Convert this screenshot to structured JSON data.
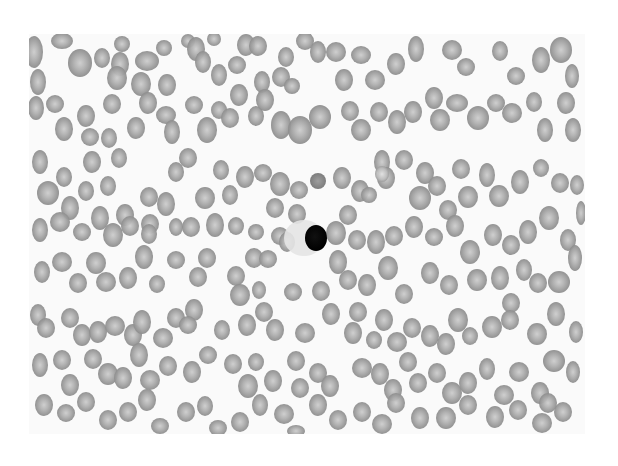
{
  "image": {
    "subject": "blood smear micrograph",
    "description": "Grayscale peripheral blood smear showing numerous red blood cells surrounding a single dark-stained nucleated cell near the center",
    "frame": {
      "x": 29,
      "y": 34,
      "width": 556,
      "height": 400
    },
    "colors": {
      "page_bg": "#ffffff",
      "field_bg": "#fafafa",
      "rbc_rim": "#8f8f8f",
      "rbc_center": "#c9c9c9",
      "rbc_dark": "#7e7e7e",
      "nucleus": "#0a0a0a",
      "halo": "#e2e2e2"
    }
  },
  "dark_cell": {
    "cx": 316,
    "cy": 238,
    "rx": 11,
    "ry": 13,
    "halo": {
      "cx": 304,
      "cy": 238,
      "rx": 20,
      "ry": 18
    }
  },
  "cells": [
    [
      34,
      52,
      9,
      16,
      0
    ],
    [
      62,
      41,
      11,
      8,
      0
    ],
    [
      80,
      63,
      12,
      14,
      0
    ],
    [
      102,
      58,
      8,
      10,
      0
    ],
    [
      38,
      82,
      8,
      13,
      0
    ],
    [
      122,
      44,
      8,
      8,
      0
    ],
    [
      120,
      64,
      9,
      12,
      0
    ],
    [
      117,
      78,
      10,
      12,
      0
    ],
    [
      147,
      61,
      12,
      10,
      0
    ],
    [
      141,
      84,
      10,
      12,
      0
    ],
    [
      164,
      48,
      8,
      8,
      0
    ],
    [
      188,
      41,
      7,
      7,
      0
    ],
    [
      167,
      85,
      9,
      11,
      0
    ],
    [
      196,
      49,
      9,
      12,
      0
    ],
    [
      203,
      62,
      8,
      11,
      0
    ],
    [
      219,
      75,
      8,
      11,
      0
    ],
    [
      214,
      39,
      7,
      7,
      0
    ],
    [
      246,
      45,
      9,
      11,
      0
    ],
    [
      258,
      46,
      9,
      10,
      0
    ],
    [
      286,
      57,
      8,
      10,
      0
    ],
    [
      305,
      41,
      9,
      9,
      0
    ],
    [
      237,
      65,
      9,
      9,
      0
    ],
    [
      281,
      77,
      9,
      10,
      0
    ],
    [
      262,
      82,
      8,
      11,
      0
    ],
    [
      292,
      86,
      8,
      8,
      0
    ],
    [
      318,
      52,
      8,
      11,
      0
    ],
    [
      336,
      52,
      10,
      10,
      0
    ],
    [
      361,
      55,
      10,
      9,
      0
    ],
    [
      344,
      80,
      9,
      11,
      0
    ],
    [
      375,
      80,
      10,
      10,
      0
    ],
    [
      396,
      64,
      9,
      11,
      0
    ],
    [
      416,
      49,
      8,
      13,
      0
    ],
    [
      452,
      50,
      10,
      10,
      0
    ],
    [
      466,
      67,
      9,
      9,
      0
    ],
    [
      500,
      51,
      8,
      10,
      0
    ],
    [
      516,
      76,
      9,
      9,
      0
    ],
    [
      541,
      60,
      9,
      13,
      0
    ],
    [
      561,
      50,
      11,
      13,
      0
    ],
    [
      572,
      76,
      7,
      12,
      0
    ],
    [
      36,
      108,
      8,
      12,
      0
    ],
    [
      55,
      104,
      9,
      9,
      0
    ],
    [
      64,
      129,
      9,
      12,
      0
    ],
    [
      86,
      116,
      9,
      11,
      0
    ],
    [
      90,
      137,
      9,
      9,
      0
    ],
    [
      112,
      104,
      9,
      10,
      0
    ],
    [
      109,
      138,
      8,
      10,
      0
    ],
    [
      136,
      128,
      9,
      11,
      0
    ],
    [
      148,
      103,
      9,
      11,
      0
    ],
    [
      166,
      115,
      10,
      9,
      0
    ],
    [
      172,
      132,
      8,
      12,
      0
    ],
    [
      194,
      105,
      9,
      9,
      0
    ],
    [
      207,
      130,
      10,
      13,
      0
    ],
    [
      219,
      110,
      8,
      9,
      0
    ],
    [
      239,
      95,
      9,
      11,
      0
    ],
    [
      230,
      118,
      9,
      10,
      0
    ],
    [
      256,
      116,
      8,
      10,
      0
    ],
    [
      265,
      100,
      9,
      11,
      0
    ],
    [
      281,
      125,
      10,
      14,
      0
    ],
    [
      300,
      130,
      12,
      14,
      0
    ],
    [
      320,
      117,
      11,
      12,
      0
    ],
    [
      350,
      111,
      9,
      10,
      0
    ],
    [
      361,
      130,
      10,
      11,
      0
    ],
    [
      379,
      112,
      9,
      10,
      0
    ],
    [
      397,
      122,
      9,
      12,
      0
    ],
    [
      413,
      112,
      9,
      11,
      0
    ],
    [
      434,
      98,
      9,
      11,
      0
    ],
    [
      440,
      120,
      10,
      11,
      0
    ],
    [
      457,
      103,
      11,
      9,
      0
    ],
    [
      478,
      118,
      11,
      12,
      0
    ],
    [
      496,
      103,
      9,
      9,
      0
    ],
    [
      512,
      113,
      10,
      10,
      0
    ],
    [
      534,
      102,
      8,
      10,
      0
    ],
    [
      545,
      130,
      8,
      12,
      0
    ],
    [
      566,
      103,
      9,
      11,
      0
    ],
    [
      573,
      130,
      8,
      12,
      0
    ],
    [
      40,
      162,
      8,
      12,
      0
    ],
    [
      48,
      193,
      11,
      12,
      0
    ],
    [
      64,
      177,
      8,
      10,
      0
    ],
    [
      70,
      208,
      9,
      12,
      0
    ],
    [
      86,
      191,
      8,
      10,
      0
    ],
    [
      92,
      162,
      9,
      11,
      0
    ],
    [
      119,
      158,
      8,
      10,
      0
    ],
    [
      108,
      186,
      8,
      10,
      0
    ],
    [
      125,
      215,
      9,
      11,
      0
    ],
    [
      149,
      197,
      9,
      10,
      0
    ],
    [
      150,
      224,
      9,
      10,
      0
    ],
    [
      176,
      172,
      8,
      10,
      0
    ],
    [
      166,
      204,
      9,
      12,
      0
    ],
    [
      188,
      158,
      9,
      10,
      0
    ],
    [
      205,
      198,
      10,
      11,
      0
    ],
    [
      221,
      170,
      8,
      10,
      0
    ],
    [
      230,
      195,
      8,
      10,
      0
    ],
    [
      245,
      177,
      9,
      11,
      0
    ],
    [
      263,
      173,
      9,
      9,
      0
    ],
    [
      280,
      184,
      10,
      12,
      0
    ],
    [
      299,
      190,
      9,
      9,
      0
    ],
    [
      318,
      181,
      8,
      8,
      2
    ],
    [
      342,
      178,
      9,
      11,
      0
    ],
    [
      360,
      191,
      9,
      11,
      0
    ],
    [
      369,
      195,
      8,
      8,
      0
    ],
    [
      382,
      162,
      8,
      12,
      0
    ],
    [
      386,
      178,
      9,
      11,
      0
    ],
    [
      404,
      160,
      9,
      10,
      0
    ],
    [
      425,
      173,
      9,
      11,
      0
    ],
    [
      420,
      198,
      11,
      12,
      0
    ],
    [
      437,
      186,
      9,
      10,
      0
    ],
    [
      448,
      210,
      9,
      10,
      0
    ],
    [
      468,
      197,
      10,
      11,
      0
    ],
    [
      487,
      175,
      8,
      12,
      0
    ],
    [
      499,
      196,
      10,
      11,
      0
    ],
    [
      520,
      182,
      9,
      12,
      0
    ],
    [
      541,
      168,
      8,
      9,
      0
    ],
    [
      560,
      183,
      9,
      10,
      0
    ],
    [
      577,
      185,
      7,
      10,
      0
    ],
    [
      461,
      169,
      9,
      10,
      0
    ],
    [
      382,
      174,
      7,
      8,
      1
    ],
    [
      40,
      230,
      8,
      12,
      0
    ],
    [
      60,
      222,
      10,
      10,
      0
    ],
    [
      82,
      232,
      9,
      9,
      0
    ],
    [
      100,
      218,
      9,
      12,
      0
    ],
    [
      113,
      235,
      10,
      12,
      0
    ],
    [
      130,
      226,
      9,
      10,
      0
    ],
    [
      149,
      234,
      8,
      10,
      0
    ],
    [
      176,
      227,
      7,
      9,
      0
    ],
    [
      191,
      227,
      9,
      10,
      0
    ],
    [
      215,
      225,
      9,
      12,
      0
    ],
    [
      236,
      226,
      8,
      9,
      0
    ],
    [
      256,
      232,
      8,
      8,
      0
    ],
    [
      275,
      208,
      9,
      10,
      0
    ],
    [
      280,
      236,
      9,
      9,
      0
    ],
    [
      254,
      258,
      9,
      10,
      0
    ],
    [
      287,
      242,
      8,
      10,
      0
    ],
    [
      297,
      214,
      9,
      10,
      0
    ],
    [
      336,
      233,
      10,
      12,
      0
    ],
    [
      348,
      215,
      9,
      10,
      0
    ],
    [
      357,
      240,
      9,
      10,
      0
    ],
    [
      376,
      242,
      9,
      12,
      0
    ],
    [
      394,
      236,
      9,
      10,
      0
    ],
    [
      414,
      227,
      9,
      11,
      0
    ],
    [
      434,
      237,
      9,
      9,
      0
    ],
    [
      455,
      226,
      9,
      11,
      0
    ],
    [
      470,
      252,
      10,
      12,
      0
    ],
    [
      493,
      235,
      9,
      11,
      0
    ],
    [
      511,
      245,
      9,
      10,
      0
    ],
    [
      528,
      232,
      9,
      12,
      0
    ],
    [
      549,
      218,
      10,
      12,
      0
    ],
    [
      568,
      240,
      8,
      11,
      0
    ],
    [
      581,
      213,
      5,
      12,
      0
    ],
    [
      42,
      272,
      8,
      11,
      0
    ],
    [
      62,
      262,
      10,
      10,
      0
    ],
    [
      78,
      283,
      9,
      10,
      0
    ],
    [
      96,
      263,
      10,
      11,
      0
    ],
    [
      106,
      282,
      10,
      10,
      0
    ],
    [
      128,
      278,
      9,
      11,
      0
    ],
    [
      144,
      257,
      9,
      12,
      0
    ],
    [
      157,
      284,
      8,
      9,
      0
    ],
    [
      176,
      260,
      9,
      9,
      0
    ],
    [
      198,
      277,
      9,
      10,
      0
    ],
    [
      207,
      258,
      9,
      10,
      0
    ],
    [
      236,
      276,
      9,
      10,
      0
    ],
    [
      240,
      295,
      10,
      11,
      0
    ],
    [
      259,
      290,
      7,
      9,
      0
    ],
    [
      268,
      259,
      9,
      9,
      0
    ],
    [
      293,
      292,
      9,
      9,
      0
    ],
    [
      321,
      291,
      9,
      10,
      0
    ],
    [
      338,
      262,
      9,
      12,
      0
    ],
    [
      348,
      280,
      9,
      10,
      0
    ],
    [
      367,
      285,
      9,
      11,
      0
    ],
    [
      388,
      268,
      10,
      12,
      0
    ],
    [
      404,
      294,
      9,
      10,
      0
    ],
    [
      430,
      273,
      9,
      11,
      0
    ],
    [
      449,
      285,
      9,
      10,
      0
    ],
    [
      477,
      280,
      10,
      11,
      0
    ],
    [
      500,
      278,
      9,
      12,
      0
    ],
    [
      511,
      303,
      9,
      10,
      0
    ],
    [
      524,
      270,
      8,
      11,
      0
    ],
    [
      538,
      283,
      9,
      10,
      0
    ],
    [
      559,
      282,
      11,
      11,
      0
    ],
    [
      575,
      258,
      7,
      13,
      0
    ],
    [
      38,
      315,
      8,
      11,
      0
    ],
    [
      46,
      328,
      9,
      10,
      0
    ],
    [
      70,
      318,
      9,
      10,
      0
    ],
    [
      82,
      335,
      9,
      11,
      0
    ],
    [
      98,
      332,
      9,
      11,
      0
    ],
    [
      115,
      326,
      10,
      10,
      0
    ],
    [
      133,
      335,
      9,
      11,
      0
    ],
    [
      142,
      322,
      9,
      12,
      0
    ],
    [
      163,
      338,
      10,
      10,
      0
    ],
    [
      176,
      318,
      9,
      10,
      0
    ],
    [
      194,
      310,
      9,
      11,
      0
    ],
    [
      188,
      325,
      9,
      9,
      0
    ],
    [
      222,
      330,
      8,
      10,
      0
    ],
    [
      247,
      325,
      9,
      11,
      0
    ],
    [
      264,
      312,
      9,
      10,
      0
    ],
    [
      275,
      330,
      9,
      11,
      0
    ],
    [
      305,
      333,
      10,
      10,
      0
    ],
    [
      331,
      314,
      9,
      11,
      0
    ],
    [
      353,
      333,
      9,
      11,
      0
    ],
    [
      358,
      312,
      9,
      10,
      0
    ],
    [
      374,
      340,
      8,
      9,
      0
    ],
    [
      384,
      320,
      9,
      11,
      0
    ],
    [
      397,
      342,
      10,
      10,
      0
    ],
    [
      412,
      328,
      9,
      10,
      0
    ],
    [
      430,
      336,
      9,
      11,
      0
    ],
    [
      446,
      344,
      9,
      11,
      0
    ],
    [
      458,
      320,
      10,
      12,
      0
    ],
    [
      470,
      336,
      8,
      9,
      0
    ],
    [
      492,
      327,
      10,
      11,
      0
    ],
    [
      510,
      320,
      9,
      10,
      0
    ],
    [
      537,
      334,
      10,
      11,
      0
    ],
    [
      556,
      314,
      9,
      12,
      0
    ],
    [
      576,
      332,
      7,
      11,
      0
    ],
    [
      40,
      365,
      8,
      12,
      0
    ],
    [
      62,
      360,
      9,
      10,
      0
    ],
    [
      70,
      385,
      9,
      11,
      0
    ],
    [
      93,
      359,
      9,
      10,
      0
    ],
    [
      108,
      374,
      10,
      11,
      0
    ],
    [
      123,
      378,
      9,
      11,
      0
    ],
    [
      139,
      355,
      9,
      12,
      0
    ],
    [
      150,
      380,
      10,
      10,
      0
    ],
    [
      168,
      366,
      9,
      10,
      0
    ],
    [
      192,
      372,
      9,
      11,
      0
    ],
    [
      208,
      355,
      9,
      9,
      0
    ],
    [
      233,
      364,
      9,
      10,
      0
    ],
    [
      248,
      386,
      10,
      12,
      0
    ],
    [
      256,
      362,
      8,
      9,
      0
    ],
    [
      273,
      381,
      9,
      11,
      0
    ],
    [
      296,
      361,
      9,
      10,
      0
    ],
    [
      300,
      388,
      9,
      10,
      0
    ],
    [
      318,
      373,
      9,
      10,
      0
    ],
    [
      330,
      386,
      9,
      11,
      0
    ],
    [
      362,
      368,
      10,
      10,
      0
    ],
    [
      380,
      374,
      9,
      11,
      0
    ],
    [
      393,
      390,
      9,
      11,
      0
    ],
    [
      408,
      362,
      9,
      10,
      0
    ],
    [
      418,
      383,
      9,
      10,
      0
    ],
    [
      437,
      373,
      9,
      10,
      0
    ],
    [
      452,
      393,
      10,
      11,
      0
    ],
    [
      468,
      383,
      9,
      11,
      0
    ],
    [
      487,
      369,
      8,
      11,
      0
    ],
    [
      504,
      395,
      10,
      10,
      0
    ],
    [
      519,
      372,
      10,
      10,
      0
    ],
    [
      540,
      393,
      9,
      11,
      0
    ],
    [
      554,
      361,
      11,
      11,
      0
    ],
    [
      573,
      372,
      7,
      11,
      0
    ],
    [
      44,
      405,
      9,
      11,
      0
    ],
    [
      66,
      413,
      9,
      9,
      0
    ],
    [
      86,
      402,
      9,
      10,
      0
    ],
    [
      108,
      420,
      9,
      10,
      0
    ],
    [
      128,
      412,
      9,
      10,
      0
    ],
    [
      147,
      400,
      9,
      11,
      0
    ],
    [
      160,
      426,
      9,
      8,
      0
    ],
    [
      186,
      412,
      9,
      10,
      0
    ],
    [
      205,
      406,
      8,
      10,
      0
    ],
    [
      218,
      428,
      9,
      8,
      0
    ],
    [
      240,
      422,
      9,
      10,
      0
    ],
    [
      260,
      405,
      8,
      11,
      0
    ],
    [
      284,
      414,
      10,
      10,
      0
    ],
    [
      296,
      431,
      9,
      6,
      0
    ],
    [
      318,
      405,
      9,
      11,
      0
    ],
    [
      338,
      420,
      9,
      10,
      0
    ],
    [
      362,
      412,
      9,
      10,
      0
    ],
    [
      382,
      424,
      10,
      10,
      0
    ],
    [
      396,
      403,
      9,
      10,
      0
    ],
    [
      420,
      418,
      9,
      11,
      0
    ],
    [
      446,
      418,
      10,
      11,
      0
    ],
    [
      468,
      405,
      9,
      10,
      0
    ],
    [
      495,
      417,
      9,
      11,
      0
    ],
    [
      518,
      410,
      9,
      10,
      0
    ],
    [
      542,
      423,
      10,
      10,
      0
    ],
    [
      563,
      412,
      9,
      10,
      0
    ],
    [
      548,
      403,
      9,
      10,
      0
    ]
  ]
}
